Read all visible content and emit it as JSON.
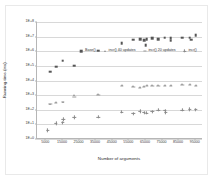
{
  "chart_data": {
    "type": "scatter",
    "title": "",
    "xlabel": "Number of arguments",
    "ylabel": "Running time (ms)",
    "yscale": "log",
    "ylim": [
      1,
      100000000
    ],
    "xlim": [
      0,
      100000
    ],
    "grid": true,
    "legend_position": "top-inside",
    "ytick_labels": [
      "1E+0",
      "1E+1",
      "1E+2",
      "1E+3",
      "1E+4",
      "1E+5",
      "1E+6",
      "1E+7",
      "1E+8"
    ],
    "ytick_values": [
      1,
      10,
      100,
      1000,
      10000,
      100000,
      1000000,
      10000000,
      100000000
    ],
    "xtick_labels": [
      "5000",
      "15000",
      "25000",
      "35000",
      "45000",
      "55000",
      "65000",
      "75000",
      "85000",
      "95000"
    ],
    "xtick_values": [
      5000,
      15000,
      25000,
      35000,
      45000,
      55000,
      65000,
      75000,
      85000,
      95000
    ],
    "series": [
      {
        "name": "Base()",
        "marker": "square",
        "color": "#555555",
        "points": [
          {
            "x": 8000,
            "y": 40000
          },
          {
            "x": 11500,
            "y": 90000
          },
          {
            "x": 15500,
            "y": 220000
          },
          {
            "x": 22500,
            "y": 105000
          },
          {
            "x": 37000,
            "y": 1100000
          },
          {
            "x": 51000,
            "y": 3600000
          },
          {
            "x": 58000,
            "y": 6200000
          },
          {
            "x": 62000,
            "y": 6700000
          },
          {
            "x": 64500,
            "y": 5500000
          },
          {
            "x": 65500,
            "y": 2700000
          },
          {
            "x": 66000,
            "y": 6500000
          },
          {
            "x": 69500,
            "y": 7800000
          },
          {
            "x": 73000,
            "y": 6900000
          },
          {
            "x": 77000,
            "y": 8500000
          },
          {
            "x": 80500,
            "y": 7500000
          },
          {
            "x": 80500,
            "y": 5200000
          },
          {
            "x": 87500,
            "y": 8200000
          },
          {
            "x": 92000,
            "y": 8400000
          },
          {
            "x": 93000,
            "y": 6000000
          },
          {
            "x": 95500,
            "y": 12000000
          }
        ]
      },
      {
        "name": "incr() 40 updates",
        "marker": "triangle",
        "color": "#8e8e8e",
        "points": [
          {
            "x": 8000,
            "y": 260
          },
          {
            "x": 11500,
            "y": 320
          },
          {
            "x": 15500,
            "y": 330
          },
          {
            "x": 22500,
            "y": 950
          },
          {
            "x": 37000,
            "y": 1200
          },
          {
            "x": 51000,
            "y": 5200
          },
          {
            "x": 58000,
            "y": 4300
          },
          {
            "x": 62000,
            "y": 3700
          },
          {
            "x": 64500,
            "y": 4200
          },
          {
            "x": 66000,
            "y": 4600
          },
          {
            "x": 69500,
            "y": 4900
          },
          {
            "x": 73000,
            "y": 5000
          },
          {
            "x": 77000,
            "y": 5200
          },
          {
            "x": 80500,
            "y": 5100
          },
          {
            "x": 87500,
            "y": 5400
          },
          {
            "x": 92000,
            "y": 5600
          },
          {
            "x": 95500,
            "y": 5100
          }
        ]
      },
      {
        "name": "incr() 20 updates",
        "marker": "dash",
        "color": "#9a9a9a",
        "points": [
          {
            "x": 8000,
            "y": 230
          },
          {
            "x": 11500,
            "y": 300
          },
          {
            "x": 15500,
            "y": 360
          },
          {
            "x": 22500,
            "y": 760
          },
          {
            "x": 37000,
            "y": 1100
          },
          {
            "x": 51000,
            "y": 4200
          },
          {
            "x": 58000,
            "y": 3500
          },
          {
            "x": 62000,
            "y": 3200
          },
          {
            "x": 64500,
            "y": 3600
          },
          {
            "x": 66000,
            "y": 3900
          },
          {
            "x": 69500,
            "y": 4100
          },
          {
            "x": 73000,
            "y": 4300
          },
          {
            "x": 77000,
            "y": 4400
          },
          {
            "x": 80500,
            "y": 4400
          },
          {
            "x": 87500,
            "y": 4700
          },
          {
            "x": 92000,
            "y": 4800
          },
          {
            "x": 95500,
            "y": 4500
          }
        ]
      },
      {
        "name": "incr()",
        "marker": "plus",
        "color": "#8a8a8a",
        "points": [
          {
            "x": 6500,
            "y": 4
          },
          {
            "x": 11500,
            "y": 12
          },
          {
            "x": 15500,
            "y": 13
          },
          {
            "x": 15800,
            "y": 22
          },
          {
            "x": 22500,
            "y": 30
          },
          {
            "x": 37000,
            "y": 32
          },
          {
            "x": 51000,
            "y": 70
          },
          {
            "x": 58000,
            "y": 55
          },
          {
            "x": 62000,
            "y": 80
          },
          {
            "x": 64500,
            "y": 62
          },
          {
            "x": 66000,
            "y": 60
          },
          {
            "x": 69500,
            "y": 75
          },
          {
            "x": 73000,
            "y": 95
          },
          {
            "x": 77000,
            "y": 88
          },
          {
            "x": 77500,
            "y": 62
          },
          {
            "x": 87500,
            "y": 95
          },
          {
            "x": 92000,
            "y": 110
          },
          {
            "x": 95500,
            "y": 100
          }
        ]
      }
    ]
  }
}
